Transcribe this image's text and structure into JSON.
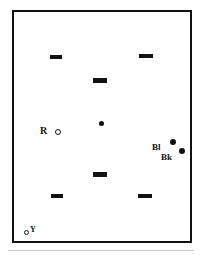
{
  "figure": {
    "background_color": "#ffffff",
    "ink_color": "#111111",
    "frame": {
      "x": 12,
      "y": 10,
      "width": 180,
      "height": 233,
      "border_width": 2,
      "border_color": "#111111"
    },
    "bottom_rule": {
      "x": 8,
      "y": 250,
      "width": 186,
      "height": 1,
      "color": "#c9c9c9"
    }
  },
  "marks": {
    "dashes": [
      {
        "id": "dash-top-left",
        "x": 50,
        "y": 55,
        "width": 12,
        "height": 4
      },
      {
        "id": "dash-top-right",
        "x": 139,
        "y": 54,
        "width": 14,
        "height": 4
      },
      {
        "id": "dash-upper-center",
        "x": 93,
        "y": 78,
        "width": 14,
        "height": 5
      },
      {
        "id": "dash-lower-center",
        "x": 93,
        "y": 172,
        "width": 14,
        "height": 5
      },
      {
        "id": "dash-bottom-left",
        "x": 51,
        "y": 194,
        "width": 12,
        "height": 4
      },
      {
        "id": "dash-bottom-right",
        "x": 138,
        "y": 194,
        "width": 14,
        "height": 4
      }
    ],
    "dots": [
      {
        "id": "dot-center",
        "x": 99,
        "y": 121,
        "size": 5
      },
      {
        "id": "dot-blue",
        "x": 170,
        "y": 139,
        "size": 6
      },
      {
        "id": "dot-black",
        "x": 179,
        "y": 148,
        "size": 6
      }
    ],
    "open_circles": [
      {
        "id": "circle-red",
        "x": 55,
        "y": 129,
        "size": 6
      },
      {
        "id": "circle-yellow",
        "x": 24,
        "y": 230,
        "size": 5
      }
    ]
  },
  "labels": {
    "red": {
      "text": "R",
      "x": 40,
      "y": 126
    },
    "blue": {
      "text": "Bl",
      "x": 152,
      "y": 143
    },
    "black": {
      "text": "Bk",
      "x": 161,
      "y": 153
    },
    "yellow": {
      "text": "Y",
      "x": 30,
      "y": 226
    }
  }
}
